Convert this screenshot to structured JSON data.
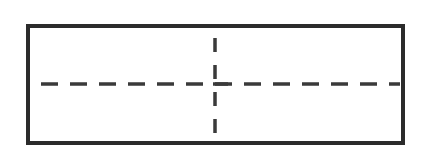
{
  "diagram": {
    "type": "rectangle-with-dashed-crosshair",
    "colors": {
      "stroke": "#2b2b2b",
      "background": "#ffffff"
    },
    "rectangle": {
      "x": 28,
      "y": 26,
      "width": 375,
      "height": 117
    },
    "horizontal_dashed_line": {
      "x1": 41,
      "x2": 400,
      "y": 84
    },
    "vertical_dashed_line": {
      "x": 215,
      "y1": 38,
      "y2": 143
    }
  }
}
